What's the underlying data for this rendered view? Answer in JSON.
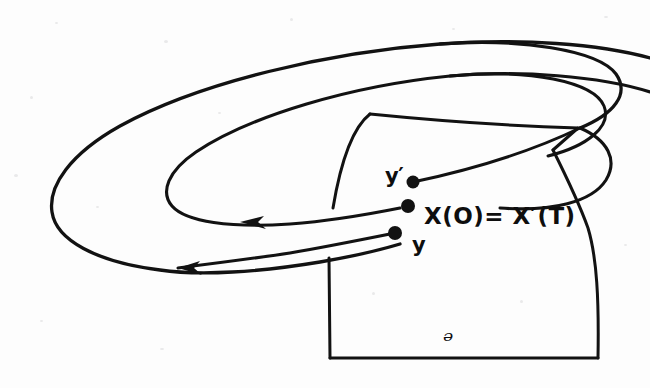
{
  "figure": {
    "kind": "hand-drawn-mathematical-diagram",
    "background_color": "#fdfdfd",
    "ink_color": "#121212",
    "canvas": {
      "width": 650,
      "height": 388
    },
    "labels": {
      "y_prime": "y′",
      "y": "y",
      "equation": "X(O)= X′(T)",
      "domain": "ᵊ"
    },
    "points": [
      {
        "name": "y-prime-point",
        "label": "y′",
        "x": 413,
        "y": 182
      },
      {
        "name": "x-zero-point",
        "label": "X(O)= X′(T)",
        "x": 408,
        "y": 206
      },
      {
        "name": "y-point",
        "label": "y",
        "x": 395,
        "y": 233
      }
    ],
    "arrows": [
      {
        "name": "inner-orbit-arrow",
        "x": 240,
        "y": 222,
        "direction": "left"
      },
      {
        "name": "outer-orbit-arrow",
        "x": 178,
        "y": 268,
        "direction": "left"
      }
    ],
    "curves": [
      {
        "name": "outer-spiral-loop",
        "stroke_width": 3.2
      },
      {
        "name": "inner-spiral-loop",
        "stroke_width": 3.0
      },
      {
        "name": "trajectory-to-y-prime",
        "stroke_width": 3.0
      },
      {
        "name": "trajectory-to-y",
        "stroke_width": 3.0
      }
    ],
    "surface": {
      "name": "transversal-section-U",
      "label": "ᵊ",
      "stroke_width": 3.0
    }
  }
}
